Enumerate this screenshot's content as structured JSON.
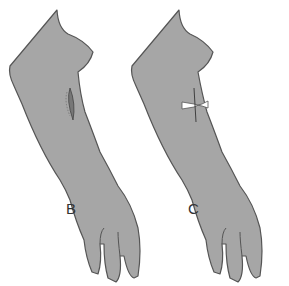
{
  "figure": {
    "panels": [
      {
        "label": "B",
        "feature": "incision-wound"
      },
      {
        "label": "C",
        "feature": "butterfly-closure"
      }
    ],
    "colors": {
      "skin": "#a6a6a6",
      "outline": "#555555",
      "background": "#ffffff",
      "bandage": "#ffffff"
    }
  }
}
